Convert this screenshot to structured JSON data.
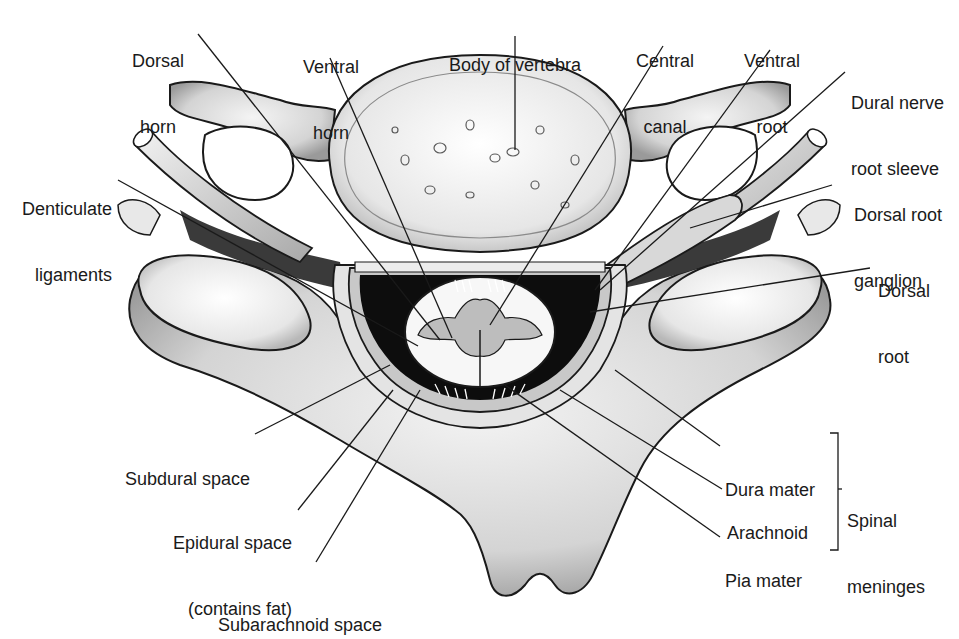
{
  "diagram": {
    "labels": {
      "dorsal_horn": {
        "line1": "Dorsal",
        "line2": "horn"
      },
      "ventral_horn": {
        "line1": "Ventral",
        "line2": "horn"
      },
      "body_of_vertebra": {
        "line1": "Body of vertebra"
      },
      "central_canal": {
        "line1": "Central",
        "line2": "canal"
      },
      "ventral_root": {
        "line1": "Ventral",
        "line2": "root"
      },
      "dural_nerve_root_sleeve": {
        "line1": "Dural nerve",
        "line2": "root sleeve"
      },
      "dorsal_root_ganglion": {
        "line1": "Dorsal root",
        "line2": "ganglion"
      },
      "dorsal_root": {
        "line1": "Dorsal",
        "line2": "root"
      },
      "denticulate_ligaments": {
        "line1": "Denticulate",
        "line2": "ligaments"
      },
      "subdural_space": {
        "line1": "Subdural space"
      },
      "epidural_space": {
        "line1": "Epidural space",
        "line2": "(contains fat)"
      },
      "subarachnoid_space": {
        "line1": "Subarachnoid space"
      },
      "dura_mater": {
        "line1": "Dura mater"
      },
      "arachnoid": {
        "line1": "Arachnoid"
      },
      "pia_mater": {
        "line1": "Pia mater"
      },
      "spinal_meninges": {
        "line1": "Spinal",
        "line2": "meninges"
      }
    },
    "colors": {
      "outline": "#1a1a1a",
      "bone": "#d6d6d6",
      "bone_light": "#efefef",
      "dark_space": "#0d0d0d",
      "gray_matter": "#bdbdbd",
      "white_matter": "#f7f7f7",
      "leader": "#1a1a1a"
    }
  }
}
